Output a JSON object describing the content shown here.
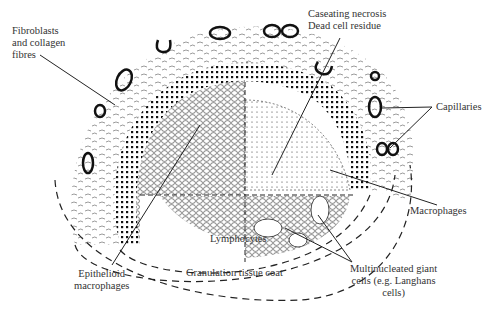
{
  "diagram": {
    "type": "anatomical-cross-section",
    "colors": {
      "ink": "#1a1a1a",
      "background": "#ffffff"
    }
  },
  "labels": {
    "fibroblasts": [
      "Fibroblasts",
      "and collagen",
      "fibres"
    ],
    "caseating": [
      "Caseating necrosis",
      "Dead cell residue"
    ],
    "capillaries": "Capillaries",
    "macrophages": "Macrophages",
    "lymphocytes": "Lymphocytes",
    "epithelioid": [
      "Epithelioid",
      "macrophages"
    ],
    "granulation": "Granulation tissue coat",
    "giant_cells": [
      "Multinucleated giant",
      "cells (e.g. Langhans",
      "cells)"
    ]
  },
  "regions": [
    "Fibrous capsule with capillaries",
    "Macrophage layer",
    "Epithelioid macrophage zone",
    "Caseating necrotic core",
    "Lymphocyte zone",
    "Granulation tissue coat"
  ]
}
